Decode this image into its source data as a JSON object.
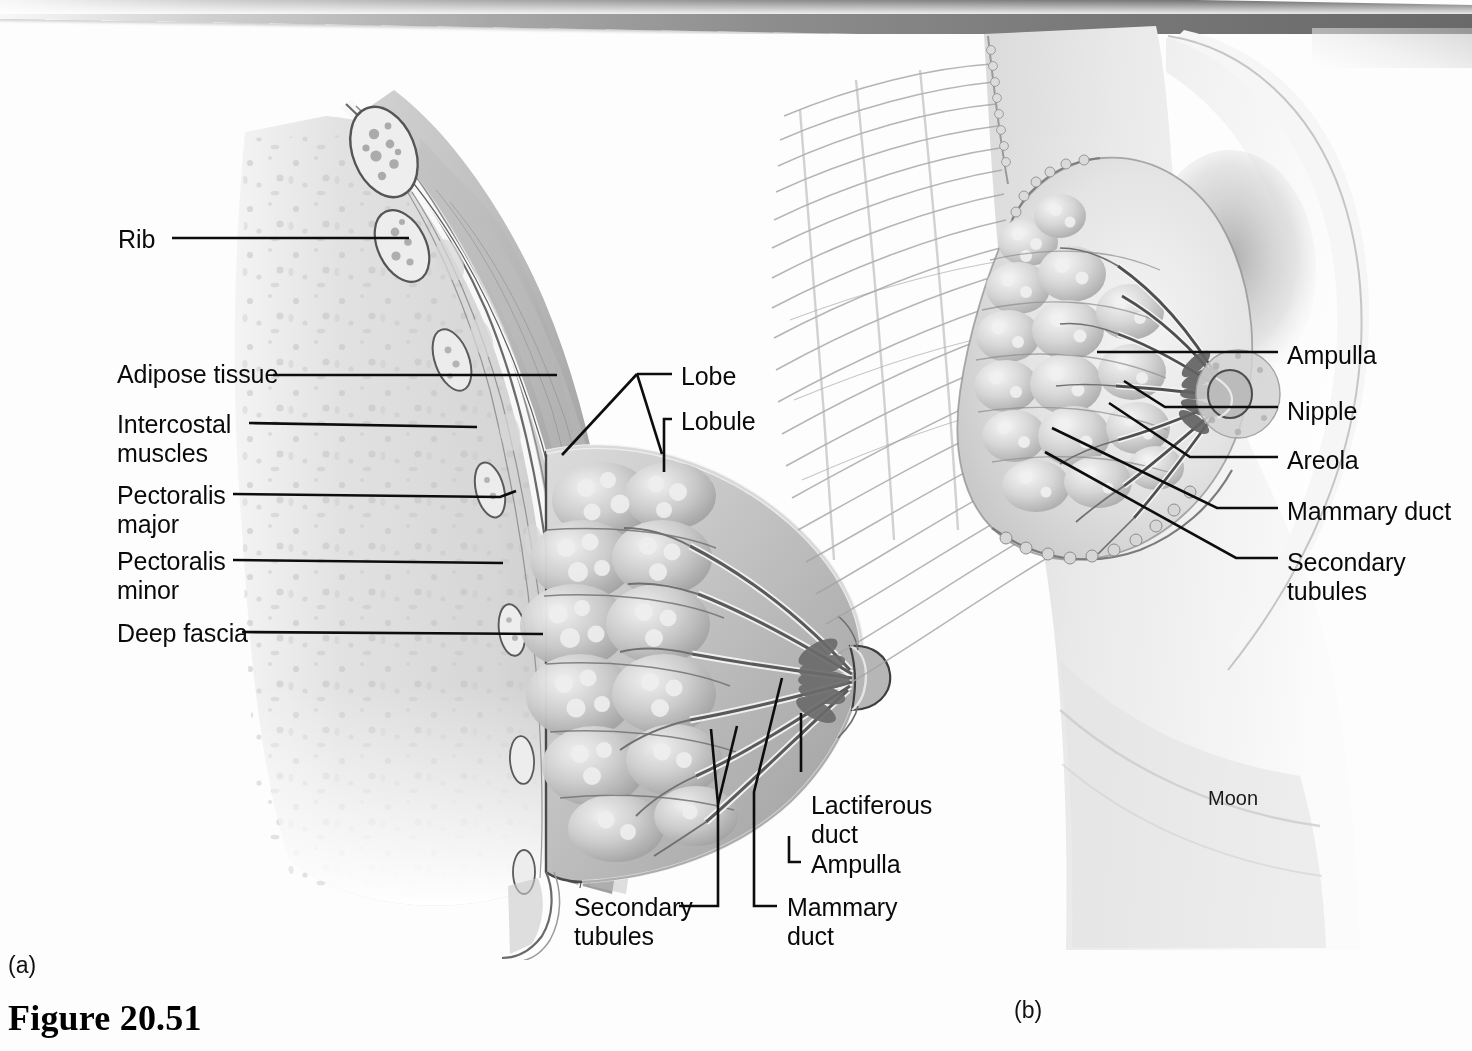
{
  "figure": {
    "caption": "Figure 20.51",
    "panel_a_tag": "(a)",
    "panel_b_tag": "(b)",
    "artist_credit": "Moon"
  },
  "panel_a": {
    "title": "Sagittal section of the breast",
    "labels": [
      {
        "id": "rib",
        "text": "Rib",
        "x": 118,
        "y": 225,
        "align": "left"
      },
      {
        "id": "adipose-tissue",
        "text": "Adipose tissue",
        "x": 117,
        "y": 360,
        "align": "left"
      },
      {
        "id": "intercostal-muscles",
        "text": "Intercostal\nmuscles",
        "x": 117,
        "y": 410,
        "align": "left"
      },
      {
        "id": "pectoralis-major",
        "text": "Pectoralis\nmajor",
        "x": 117,
        "y": 481,
        "align": "left"
      },
      {
        "id": "pectoralis-minor",
        "text": "Pectoralis\nminor",
        "x": 117,
        "y": 547,
        "align": "left"
      },
      {
        "id": "deep-fascia",
        "text": "Deep fascia",
        "x": 117,
        "y": 619,
        "align": "left"
      },
      {
        "id": "lobe",
        "text": "Lobe",
        "x": 681,
        "y": 362,
        "align": "left"
      },
      {
        "id": "lobule",
        "text": "Lobule",
        "x": 681,
        "y": 407,
        "align": "left"
      },
      {
        "id": "lactiferous-duct",
        "text": "Lactiferous\nduct",
        "x": 811,
        "y": 791,
        "align": "left"
      },
      {
        "id": "ampulla-a",
        "text": "Ampulla",
        "x": 811,
        "y": 850,
        "align": "left"
      },
      {
        "id": "secondary-tubules-a",
        "text": "Secondary\ntubules",
        "x": 574,
        "y": 893,
        "align": "left"
      },
      {
        "id": "mammary-duct-a",
        "text": "Mammary\nduct",
        "x": 787,
        "y": 893,
        "align": "left"
      }
    ]
  },
  "panel_b": {
    "title": "Anterior view of the partially dissected breast",
    "labels": [
      {
        "id": "ampulla-b",
        "text": "Ampulla",
        "x": 1287,
        "y": 341,
        "align": "left"
      },
      {
        "id": "nipple",
        "text": "Nipple",
        "x": 1287,
        "y": 397,
        "align": "left"
      },
      {
        "id": "areola",
        "text": "Areola",
        "x": 1287,
        "y": 446,
        "align": "left"
      },
      {
        "id": "mammary-duct-b",
        "text": "Mammary duct",
        "x": 1287,
        "y": 497,
        "align": "left"
      },
      {
        "id": "secondary-tubules-b",
        "text": "Secondary\ntubules",
        "x": 1287,
        "y": 548,
        "align": "left"
      }
    ]
  },
  "leaders": {
    "stroke": "#0d0d0d",
    "width": 2.6,
    "panel_a": [
      {
        "id": "leader-rib",
        "points": "172,238 409,238"
      },
      {
        "id": "leader-adipose-tissue",
        "points": "273,375 557,375"
      },
      {
        "id": "leader-intercostal-muscles",
        "points": "249,423 477,427"
      },
      {
        "id": "leader-pectoralis-major",
        "points": "233,494 500,497 516,491"
      },
      {
        "id": "leader-pectoralis-minor",
        "points": "233,560 503,563"
      },
      {
        "id": "leader-deep-fascia",
        "points": "242,632 543,634"
      },
      {
        "id": "leader-lobe-stem",
        "points": "672,374 637,374"
      },
      {
        "id": "leader-lobe-branch1",
        "points": "637,374 562,455"
      },
      {
        "id": "leader-lobe-branch2",
        "points": "637,374 662,454"
      },
      {
        "id": "leader-lobule",
        "points": "672,419 664,419 664,472"
      },
      {
        "id": "leader-lactiferous-duct",
        "points": "801,772 801,713"
      },
      {
        "id": "leader-ampulla-a",
        "points": "801,862 789,862 789,836"
      },
      {
        "id": "leader-secondary-tubules-a",
        "points": "679,906 718,906 718,804 711,729"
      },
      {
        "id": "leader-secondary-tubules-a2",
        "points": "718,804 737,726"
      },
      {
        "id": "leader-mammary-duct-a",
        "points": "777,906 754,906 754,792 782,678"
      }
    ],
    "panel_b": [
      {
        "id": "leader-ampulla-b",
        "points": "1278,352 1097,352"
      },
      {
        "id": "leader-nipple",
        "points": "1278,407 1165,407 1124,381"
      },
      {
        "id": "leader-areola",
        "points": "1278,457 1190,457 1109,403"
      },
      {
        "id": "leader-mammary-duct-b",
        "points": "1278,508 1217,508 1052,428"
      },
      {
        "id": "leader-secondary-tubules-b",
        "points": "1278,558 1236,558 1045,452"
      }
    ]
  },
  "illustration": {
    "panel_a_description": "Sagittal cut through the chest wall and breast showing ribs, intercostal muscles, pectoralis major and minor, deep fascia, adipose tissue and the glandular lobes with lactiferous ducts converging on the nipple.",
    "panel_b_description": "Anterior view of the right breast with overlying skin and fat removed on its lateral half to expose the mammary lobes, ducts, ampullae and nipple against the chest and upper arm.",
    "tone_light": "#e8e8e8",
    "tone_mid": "#c4c4c4",
    "tone_dark": "#8e8e8e",
    "tone_deepest": "#5e5e5e",
    "outline": "#3a3a3a"
  }
}
